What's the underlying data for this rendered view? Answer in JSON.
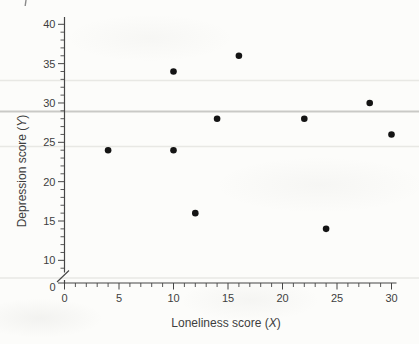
{
  "chart_data": {
    "type": "scatter",
    "title": "",
    "xlabel": "Loneliness score (X)",
    "ylabel": "Depression score (Y)",
    "xlabel_parts": {
      "prefix": "Loneliness score (",
      "var": "X",
      "suffix": ")"
    },
    "ylabel_parts": {
      "prefix": "Depression score (",
      "var": "Y",
      "suffix": ")"
    },
    "points": [
      {
        "x": 4,
        "y": 24
      },
      {
        "x": 10,
        "y": 24
      },
      {
        "x": 10,
        "y": 34
      },
      {
        "x": 12,
        "y": 16
      },
      {
        "x": 14,
        "y": 28
      },
      {
        "x": 16,
        "y": 36
      },
      {
        "x": 22,
        "y": 28
      },
      {
        "x": 24,
        "y": 14
      },
      {
        "x": 28,
        "y": 30
      },
      {
        "x": 30,
        "y": 26
      }
    ],
    "x_tick_labels": [
      0,
      5,
      10,
      15,
      20,
      25,
      30
    ],
    "y_tick_labels": [
      10,
      15,
      20,
      25,
      30,
      35,
      40
    ],
    "y_origin_label": "0",
    "minor_tick_step": 1,
    "xlim": [
      0,
      30
    ],
    "ylim": [
      10,
      40
    ],
    "y_axis_break": true,
    "grid": false,
    "legend": null,
    "colors": {
      "marker": "#141414",
      "axis": "#454545",
      "text": "#3e3e3e",
      "artifact_line_strong": "#c9c9c6",
      "artifact_line_faint": "#e8e8e4",
      "stray_mark": "#8a8a8a"
    }
  },
  "scan_artifacts": {
    "horizontal_lines": [
      {
        "y_px": 80.5,
        "strength": "faint"
      },
      {
        "y_px": 111.5,
        "strength": "strong"
      },
      {
        "y_px": 146.5,
        "strength": "faint"
      },
      {
        "y_px": 278.0,
        "strength": "faint"
      }
    ],
    "top_left_mark": {
      "x_px": 26,
      "y_px": 0,
      "height_px": 6
    }
  }
}
